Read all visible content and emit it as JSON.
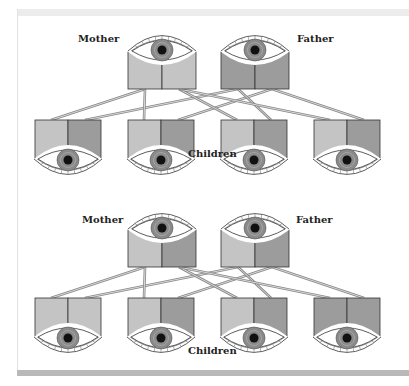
{
  "panels": [
    {
      "mother_label": "Mother",
      "father_label": "Father",
      "children_label": "Children",
      "mother_alleles": [
        "light",
        "light"
      ],
      "father_alleles": [
        "dark",
        "dark"
      ],
      "children_alleles": [
        [
          "light",
          "dark"
        ],
        [
          "light",
          "dark"
        ],
        [
          "light",
          "dark"
        ],
        [
          "light",
          "dark"
        ]
      ]
    },
    {
      "mother_label": "Mother",
      "father_label": "Father",
      "children_label": "Children",
      "mother_alleles": [
        "light",
        "dark"
      ],
      "father_alleles": [
        "light",
        "dark"
      ],
      "children_alleles": [
        [
          "light",
          "light"
        ],
        [
          "light",
          "dark"
        ],
        [
          "light",
          "dark"
        ],
        [
          "dark",
          "dark"
        ]
      ]
    }
  ],
  "colors": {
    "light": "#c4c4c4",
    "dark": "#9c9c9c",
    "iris": "#8a8a8a",
    "pupil": "#111111",
    "line": "#a8a8a8"
  }
}
